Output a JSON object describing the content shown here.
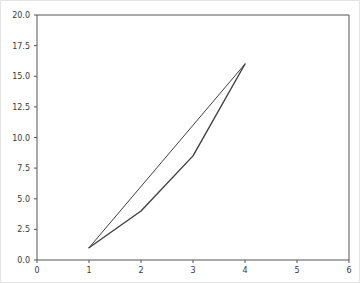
{
  "figure": {
    "background_color": "#ffffff",
    "border_color": "#e3e3e3",
    "width": 360,
    "height": 283
  },
  "axes": {
    "spine_color": "#555555",
    "tick_color": "#555555",
    "label_color": "#3a3a3a"
  },
  "chart_data": {
    "type": "line",
    "title": "",
    "xlabel": "",
    "ylabel": "",
    "xlim": [
      0,
      6
    ],
    "ylim": [
      0,
      20
    ],
    "grid": false,
    "legend": "none",
    "xticks": [
      0,
      1,
      2,
      3,
      4,
      5,
      6
    ],
    "xticklabels": [
      "0",
      "1",
      "2",
      "3",
      "4",
      "5",
      "6"
    ],
    "yticks": [
      0.0,
      2.5,
      5.0,
      7.5,
      10.0,
      12.5,
      15.0,
      17.5,
      20.0
    ],
    "yticklabels": [
      "0.0",
      "2.5",
      "5.0",
      "7.5",
      "10.0",
      "12.5",
      "15.0",
      "17.5",
      "20.0"
    ],
    "series": [
      {
        "name": "straight-segment",
        "color": "#404040",
        "linewidth": 1,
        "x": [
          1,
          4
        ],
        "values": [
          1,
          16
        ]
      },
      {
        "name": "piecewise-curve",
        "color": "#404040",
        "linewidth": 1.4,
        "x": [
          1,
          2,
          3,
          4
        ],
        "values": [
          1,
          4,
          8.5,
          16
        ]
      }
    ]
  }
}
